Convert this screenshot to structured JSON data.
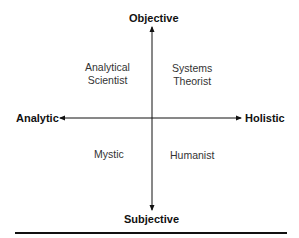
{
  "diagram": {
    "axes": {
      "top": "Objective",
      "bottom": "Subjective",
      "left": "Analytic",
      "right": "Holistic"
    },
    "quadrants": {
      "top_left": [
        "Analytical",
        "Scientist"
      ],
      "top_right": [
        "Systems",
        "Theorist"
      ],
      "bottom_left": [
        "Mystic"
      ],
      "bottom_right": [
        "Humanist"
      ]
    }
  }
}
